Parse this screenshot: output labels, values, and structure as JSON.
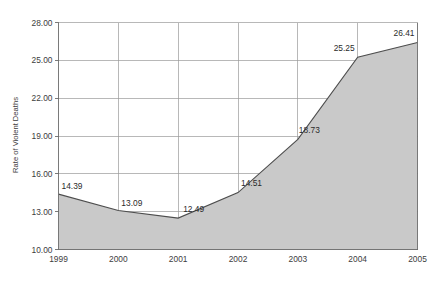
{
  "chart_data": {
    "type": "area",
    "title": "",
    "xlabel": "",
    "ylabel": "Rate of Violent Deaths",
    "categories": [
      "1999",
      "2000",
      "2001",
      "2002",
      "2003",
      "2004",
      "2005"
    ],
    "values": [
      14.39,
      13.09,
      12.49,
      14.51,
      18.73,
      25.25,
      26.41
    ],
    "point_labels": [
      "14.39",
      "13.09",
      "12.49",
      "14.51",
      "18.73",
      "25.25",
      "26.41"
    ],
    "ylim": [
      10.0,
      28.0
    ],
    "yticks": [
      10.0,
      13.0,
      16.0,
      19.0,
      22.0,
      25.0,
      28.0
    ],
    "ytick_labels": [
      "10.00",
      "13.00",
      "16.00",
      "19.00",
      "22.00",
      "25.00",
      "28.00"
    ],
    "xtick_labels": [
      "1999",
      "2000",
      "2001",
      "2002",
      "2003",
      "2004",
      "2005"
    ],
    "grid": true,
    "legend": false,
    "legend_position": "none",
    "colors": {
      "area_fill": "#c9c9c9",
      "area_stroke": "#4d4d4d",
      "gridline": "#9a9a9a",
      "axis": "#6b6b6b",
      "text": "#3d3d3d",
      "background": "#ffffff"
    }
  }
}
